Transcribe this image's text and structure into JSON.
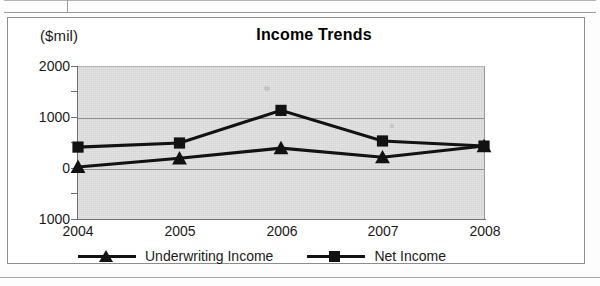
{
  "document": {
    "table_fragment_present": true,
    "bottom_rule_present": true
  },
  "chart_data": {
    "type": "line",
    "title": "Income Trends",
    "ylabel": "($mil)",
    "xlabel": "",
    "categories": [
      "2004",
      "2005",
      "2006",
      "2007",
      "2008"
    ],
    "ytick_labels": [
      "2000",
      "1000",
      "0",
      "1000"
    ],
    "ytick_values": [
      2000,
      1000,
      0,
      -1000
    ],
    "ylim": [
      -1000,
      2000
    ],
    "grid": true,
    "legend_position": "bottom",
    "plot_background": "#d5d5d5",
    "series": [
      {
        "name": "Underwriting Income",
        "marker": "triangle",
        "color": "#121212",
        "values": [
          20,
          190,
          390,
          210,
          430
        ]
      },
      {
        "name": "Net Income",
        "marker": "square",
        "color": "#121212",
        "values": [
          410,
          490,
          1130,
          530,
          430
        ]
      }
    ]
  },
  "legend": {
    "items": [
      {
        "label": "Underwriting Income",
        "marker": "triangle"
      },
      {
        "label": "Net Income",
        "marker": "square"
      }
    ]
  }
}
